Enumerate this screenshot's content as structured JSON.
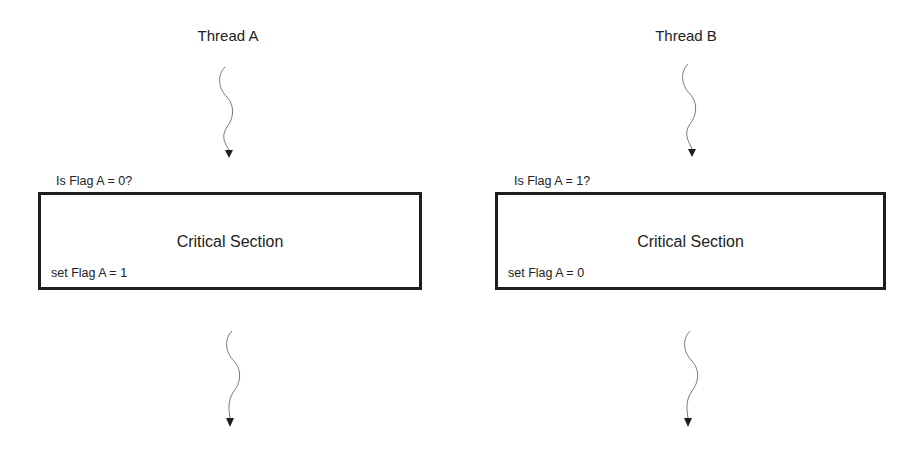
{
  "threads": [
    {
      "title": "Thread A",
      "condition": "Is Flag A = 0?",
      "section_label": "Critical Section",
      "action": "set Flag A = 1"
    },
    {
      "title": "Thread B",
      "condition": "Is Flag A = 1?",
      "section_label": "Critical Section",
      "action": "set Flag A = 0"
    }
  ],
  "colors": {
    "stroke": "#1e1e1e",
    "wavy_line": "#777777",
    "text": "#222222"
  }
}
